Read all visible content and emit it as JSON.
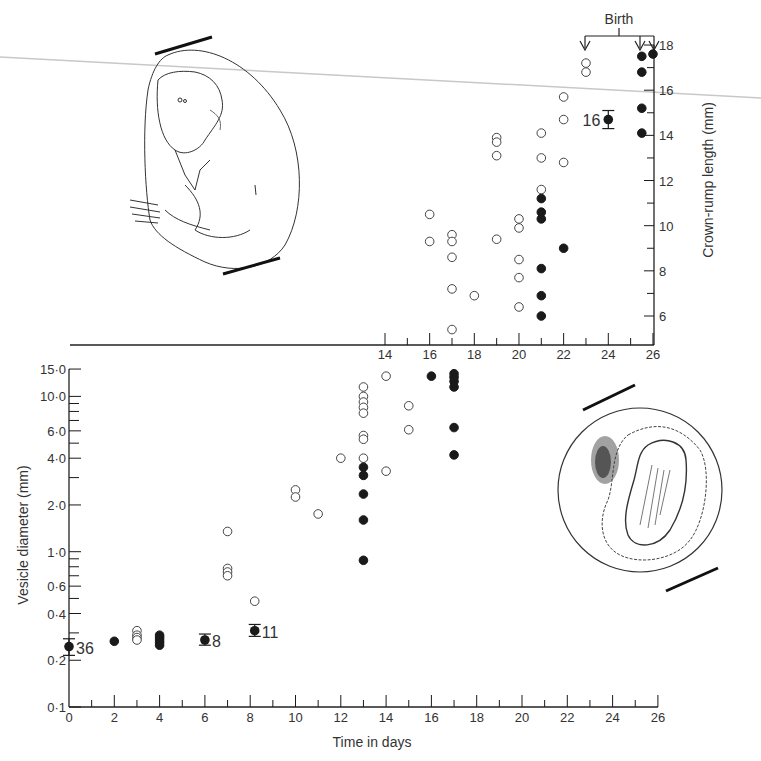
{
  "chart_data": [
    {
      "id": "upper",
      "type": "scatter",
      "title": "",
      "xlabel": "",
      "ylabel": "Crown-rump length (mm)",
      "xlim": [
        14,
        26
      ],
      "ylim": [
        6,
        18
      ],
      "x_ticks": [
        14,
        16,
        18,
        20,
        22,
        24,
        26
      ],
      "y_ticks": [
        6,
        8,
        10,
        12,
        14,
        16,
        18
      ],
      "y_axis_position": "right",
      "grid": false,
      "annotation": {
        "label": "Birth",
        "arrows_at": [
          23,
          25.5,
          26
        ]
      },
      "series": [
        {
          "name": "open",
          "marker": "open-circle",
          "points": [
            [
              16,
              10.5
            ],
            [
              16,
              9.3
            ],
            [
              17,
              9.6
            ],
            [
              17,
              9.3
            ],
            [
              17,
              8.6
            ],
            [
              17,
              7.2
            ],
            [
              17,
              5.4
            ],
            [
              18,
              6.9
            ],
            [
              19,
              13.9
            ],
            [
              19,
              13.7
            ],
            [
              19,
              13.1
            ],
            [
              19,
              9.4
            ],
            [
              20,
              10.3
            ],
            [
              20,
              9.9
            ],
            [
              20,
              8.5
            ],
            [
              20,
              7.7
            ],
            [
              20,
              6.4
            ],
            [
              21,
              14.1
            ],
            [
              21,
              13.0
            ],
            [
              21,
              11.6
            ],
            [
              22,
              15.7
            ],
            [
              22,
              14.7
            ],
            [
              22,
              12.8
            ],
            [
              23,
              17.2
            ],
            [
              23,
              16.8
            ]
          ]
        },
        {
          "name": "filled",
          "marker": "filled-circle",
          "points": [
            [
              21,
              11.2
            ],
            [
              21,
              10.6
            ],
            [
              21,
              10.3
            ],
            [
              21,
              8.1
            ],
            [
              21,
              6.9
            ],
            [
              21,
              6.0
            ],
            [
              22,
              9.0
            ],
            [
              25.5,
              17.5
            ],
            [
              25.5,
              16.8
            ],
            [
              25.5,
              15.2
            ],
            [
              25.5,
              14.1
            ],
            [
              26,
              17.6
            ]
          ]
        },
        {
          "name": "mean",
          "marker": "filled-circle-errorbar",
          "points": [
            {
              "x": 24,
              "y": 14.7,
              "err": 0.4,
              "label": "16"
            }
          ]
        }
      ]
    },
    {
      "id": "lower",
      "type": "scatter",
      "title": "",
      "xlabel": "Time in days",
      "ylabel": "Vesicle diameter (mm)",
      "yscale": "log",
      "xlim": [
        0,
        26
      ],
      "ylim": [
        0.1,
        15.0
      ],
      "x_ticks": [
        0,
        2,
        4,
        6,
        8,
        10,
        12,
        14,
        16,
        18,
        20,
        22,
        24,
        26
      ],
      "y_tick_labels": [
        "0·1",
        "0·2",
        "0·4",
        "0·6",
        "1·0",
        "2·0",
        "4·0",
        "6·0",
        "10·0",
        "15·0"
      ],
      "y_ticks": [
        0.1,
        0.2,
        0.4,
        0.6,
        1.0,
        2.0,
        4.0,
        6.0,
        10.0,
        15.0
      ],
      "grid": false,
      "series": [
        {
          "name": "open",
          "marker": "open-circle",
          "points": [
            [
              3,
              0.31
            ],
            [
              3,
              0.29
            ],
            [
              3,
              0.28
            ],
            [
              3,
              0.27
            ],
            [
              7,
              1.35
            ],
            [
              7,
              0.78
            ],
            [
              7,
              0.74
            ],
            [
              7,
              0.7
            ],
            [
              8.2,
              0.48
            ],
            [
              10,
              2.5
            ],
            [
              10,
              2.25
            ],
            [
              11,
              1.75
            ],
            [
              12,
              4.0
            ],
            [
              13,
              11.5
            ],
            [
              13,
              10.0
            ],
            [
              13,
              9.2
            ],
            [
              13,
              8.5
            ],
            [
              13,
              7.8
            ],
            [
              13,
              5.6
            ],
            [
              13,
              5.3
            ],
            [
              13,
              4.0
            ],
            [
              14,
              13.5
            ],
            [
              14,
              3.3
            ],
            [
              15,
              8.7
            ],
            [
              15,
              6.1
            ]
          ]
        },
        {
          "name": "filled",
          "marker": "filled-circle",
          "points": [
            [
              2,
              0.265
            ],
            [
              4,
              0.29
            ],
            [
              4,
              0.28
            ],
            [
              4,
              0.27
            ],
            [
              4,
              0.26
            ],
            [
              4,
              0.25
            ],
            [
              13,
              3.5
            ],
            [
              13,
              3.1
            ],
            [
              13,
              2.35
            ],
            [
              13,
              1.6
            ],
            [
              13,
              0.88
            ],
            [
              16,
              13.5
            ],
            [
              17,
              14.0
            ],
            [
              17,
              13.3
            ],
            [
              17,
              12.5
            ],
            [
              17,
              11.5
            ],
            [
              17,
              6.3
            ],
            [
              17,
              4.2
            ]
          ]
        },
        {
          "name": "mean",
          "marker": "filled-circle-errorbar",
          "points": [
            {
              "x": 0,
              "y": 0.245,
              "err_low": 0.215,
              "err_high": 0.275,
              "label": "36"
            },
            {
              "x": 6,
              "y": 0.27,
              "err_low": 0.25,
              "err_high": 0.295,
              "label": "8"
            },
            {
              "x": 8.2,
              "y": 0.31,
              "err_low": 0.285,
              "err_high": 0.34,
              "label": "11"
            }
          ]
        }
      ]
    }
  ],
  "labels": {
    "birth": "Birth",
    "upper_ylabel": "Crown-rump length (mm)",
    "lower_ylabel": "Vesicle diameter (mm)",
    "lower_xlabel": "Time in days"
  },
  "illustrations": {
    "upper": "fetus-in-membrane-drawing",
    "lower": "embryonic-vesicle-drawing"
  },
  "colors": {
    "ink": "#1a1a1a",
    "text": "#333333",
    "guide_line": "#c8c8c8",
    "background": "#ffffff"
  }
}
